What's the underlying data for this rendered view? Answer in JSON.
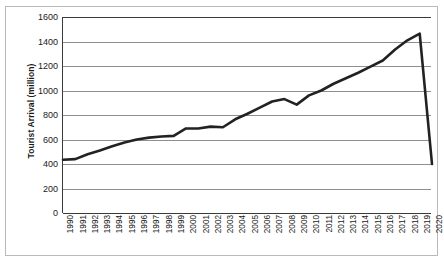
{
  "chart_data": {
    "type": "line",
    "title": "",
    "xlabel": "",
    "ylabel": "Tourist Arrival (million)",
    "ylim": [
      0,
      1600
    ],
    "ytick_step": 200,
    "yticks": [
      "1600",
      "1400",
      "1200",
      "1000",
      "800",
      "600",
      "400",
      "200",
      "0"
    ],
    "grid": true,
    "legend": "none",
    "line_color": "#222222",
    "grid_color": "#8f8f8f",
    "axis_color": "#3b3b3b",
    "categories": [
      "1990",
      "1991",
      "1992",
      "1993",
      "1994",
      "1995",
      "1996",
      "1997",
      "1998",
      "1999",
      "2000",
      "2001",
      "2002",
      "2003",
      "2004",
      "2005",
      "2006",
      "2007",
      "2008",
      "2009",
      "2010",
      "2011",
      "2012",
      "2013",
      "2014",
      "2015",
      "2016",
      "2017",
      "2018",
      "2019",
      "2020"
    ],
    "values": [
      435,
      440,
      480,
      510,
      545,
      575,
      600,
      615,
      625,
      630,
      690,
      690,
      705,
      700,
      765,
      810,
      860,
      910,
      930,
      885,
      960,
      1000,
      1055,
      1100,
      1145,
      1195,
      1245,
      1335,
      1410,
      1465,
      400
    ],
    "series": [
      {
        "name": "Tourist Arrival (million)",
        "values": [
          435,
          440,
          480,
          510,
          545,
          575,
          600,
          615,
          625,
          630,
          690,
          690,
          705,
          700,
          765,
          810,
          860,
          910,
          930,
          885,
          960,
          1000,
          1055,
          1100,
          1145,
          1195,
          1245,
          1335,
          1410,
          1465,
          400
        ]
      }
    ]
  }
}
